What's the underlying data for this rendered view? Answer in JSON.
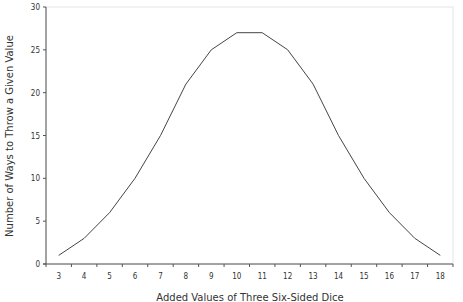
{
  "chart_data": {
    "type": "line",
    "title": "",
    "xlabel": "Added Values of Three Six-Sided Dice",
    "ylabel": "Number of Ways to Throw a Given Value",
    "categories": [
      "3",
      "4",
      "5",
      "6",
      "7",
      "8",
      "9",
      "10",
      "11",
      "12",
      "13",
      "14",
      "15",
      "16",
      "17",
      "18"
    ],
    "series": [
      {
        "name": "Ways",
        "values": [
          1,
          3,
          6,
          10,
          15,
          21,
          25,
          27,
          27,
          25,
          21,
          15,
          10,
          6,
          3,
          1
        ]
      }
    ],
    "ylim": [
      0,
      30
    ],
    "yticks": [
      0,
      5,
      10,
      15,
      20,
      25,
      30
    ],
    "grid": false,
    "legend": "none",
    "line_color": "#444444"
  }
}
